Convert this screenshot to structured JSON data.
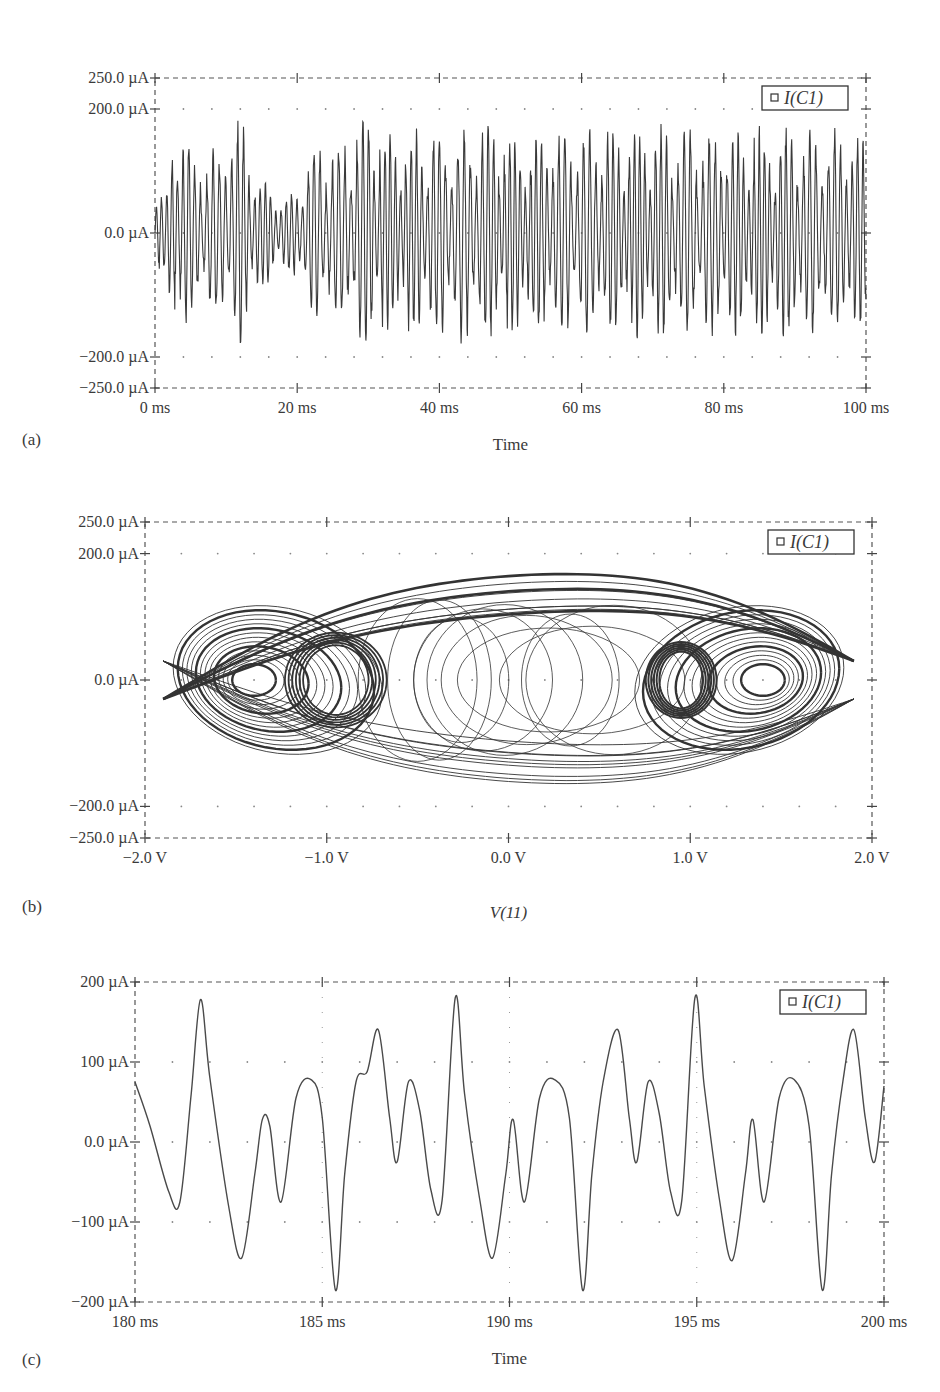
{
  "chart_data": [
    {
      "id": "a",
      "type": "line",
      "panel_label": "(a)",
      "title": "",
      "xlabel": "Time",
      "ylabel": "",
      "legend": [
        {
          "marker": "square",
          "label": "I(C1)"
        }
      ],
      "legend_position": "top-right",
      "xlim": [
        0,
        100
      ],
      "x_unit": "ms",
      "ylim": [
        -250,
        250
      ],
      "y_unit": "µA",
      "grid": "dotted",
      "xticks": [
        0,
        20,
        40,
        60,
        80,
        100
      ],
      "xtick_labels": [
        "0 ms",
        "20 ms",
        "40 ms",
        "60 ms",
        "80 ms",
        "100 ms"
      ],
      "yticks": [
        250,
        200,
        0,
        -200,
        -250
      ],
      "ytick_labels": [
        "250.0 µA",
        "200.0 µA",
        "0.0 µA",
        "−200.0 µA",
        "−250.0 µA"
      ],
      "series": [
        {
          "name": "I(C1)",
          "description": "Dense chaotic oscillation, roughly ±200 µA envelope, ~1.2 kHz carrier",
          "envelope_peaks_uA": {
            "max": 210,
            "min": -230
          },
          "approx_samples_ms_uA": [
            [
              0.3,
              80
            ],
            [
              1.5,
              -60
            ],
            [
              2.5,
              160
            ],
            [
              3.3,
              -230
            ],
            [
              4.2,
              180
            ],
            [
              5.2,
              -130
            ],
            [
              7,
              140
            ],
            [
              9,
              -140
            ],
            [
              10,
              180
            ],
            [
              12,
              -200
            ],
            [
              14,
              110
            ],
            [
              16,
              -90
            ],
            [
              18,
              60
            ],
            [
              20,
              -80
            ],
            [
              22,
              150
            ],
            [
              24,
              -150
            ],
            [
              26,
              150
            ],
            [
              28,
              -190
            ],
            [
              30,
              210
            ],
            [
              32,
              -180
            ],
            [
              36,
              170
            ],
            [
              38,
              -180
            ],
            [
              44,
              180
            ],
            [
              46,
              -200
            ],
            [
              50,
              180
            ],
            [
              52,
              -170
            ],
            [
              60,
              180
            ],
            [
              62,
              -180
            ],
            [
              70,
              180
            ],
            [
              72,
              -180
            ],
            [
              80,
              180
            ],
            [
              84,
              -180
            ],
            [
              90,
              180
            ],
            [
              94,
              -180
            ],
            [
              99,
              180
            ],
            [
              100,
              -140
            ]
          ]
        }
      ]
    },
    {
      "id": "b",
      "type": "line",
      "subtype": "phase-portrait",
      "panel_label": "(b)",
      "title": "",
      "xlabel": "V(11)",
      "ylabel": "",
      "legend": [
        {
          "marker": "square",
          "label": "I(C1)"
        }
      ],
      "legend_position": "top-right",
      "xlim": [
        -2.0,
        2.0
      ],
      "x_unit": "V",
      "ylim": [
        -250,
        250
      ],
      "y_unit": "µA",
      "grid": "dotted",
      "xticks": [
        -2,
        -1,
        0,
        1,
        2
      ],
      "xtick_labels": [
        "−2.0 V",
        "−1.0 V",
        "0.0 V",
        "1.0 V",
        "2.0 V"
      ],
      "yticks": [
        250,
        200,
        0,
        -200,
        -250
      ],
      "ytick_labels": [
        "250.0 µA",
        "200.0 µA",
        "0.0 µA",
        "−200.0 µA",
        "−250.0 µA"
      ],
      "series": [
        {
          "name": "I(C1)",
          "description": "Double-scroll chaotic attractor; scroll centers near (−1.4 V, 0) and (1.4 V, 0); inner loops near ±1.0 V",
          "extent": {
            "x": [
              -1.95,
              1.95
            ],
            "y": [
              -230,
              210
            ]
          },
          "scroll_centers": [
            [
              -1.4,
              0
            ],
            [
              1.4,
              0
            ]
          ],
          "inner_loop_centers": [
            [
              -1.0,
              0
            ],
            [
              1.0,
              0
            ]
          ]
        }
      ]
    },
    {
      "id": "c",
      "type": "line",
      "panel_label": "(c)",
      "title": "",
      "xlabel": "Time",
      "ylabel": "",
      "legend": [
        {
          "marker": "square",
          "label": "I(C1)"
        }
      ],
      "legend_position": "top-right",
      "xlim": [
        180,
        200
      ],
      "x_unit": "ms",
      "ylim": [
        -200,
        200
      ],
      "y_unit": "µA",
      "grid": "dotted",
      "xticks": [
        180,
        185,
        190,
        195,
        200
      ],
      "xtick_labels": [
        "180 ms",
        "185 ms",
        "190 ms",
        "195 ms",
        "200 ms"
      ],
      "yticks": [
        200,
        100,
        0,
        -100,
        -200
      ],
      "ytick_labels": [
        "200 µA",
        "100 µA",
        "0.0 µA",
        "−100 µA",
        "−200 µA"
      ],
      "series": [
        {
          "name": "I(C1)",
          "description": "Zoomed periodic-like waveform, period ≈ 3.9 ms with multiple sub-peaks",
          "points": [
            [
              180.0,
              75
            ],
            [
              180.4,
              20
            ],
            [
              180.9,
              -62
            ],
            [
              181.2,
              -75
            ],
            [
              181.5,
              60
            ],
            [
              181.75,
              178
            ],
            [
              182.0,
              80
            ],
            [
              182.5,
              -80
            ],
            [
              182.85,
              -145
            ],
            [
              183.2,
              -40
            ],
            [
              183.4,
              28
            ],
            [
              183.6,
              20
            ],
            [
              183.9,
              -75
            ],
            [
              184.3,
              55
            ],
            [
              184.7,
              78
            ],
            [
              185.0,
              30
            ],
            [
              185.35,
              -185
            ],
            [
              185.6,
              -40
            ],
            [
              185.9,
              75
            ],
            [
              186.2,
              88
            ],
            [
              186.5,
              140
            ],
            [
              186.8,
              30
            ],
            [
              187.0,
              -25
            ],
            [
              187.3,
              75
            ],
            [
              187.6,
              40
            ],
            [
              187.9,
              -60
            ],
            [
              188.2,
              -73
            ],
            [
              188.55,
              180
            ],
            [
              188.8,
              60
            ],
            [
              189.2,
              -70
            ],
            [
              189.55,
              -145
            ],
            [
              189.9,
              -40
            ],
            [
              190.1,
              28
            ],
            [
              190.4,
              -75
            ],
            [
              190.8,
              55
            ],
            [
              191.2,
              78
            ],
            [
              191.6,
              30
            ],
            [
              191.95,
              -185
            ],
            [
              192.2,
              -40
            ],
            [
              192.5,
              75
            ],
            [
              192.9,
              140
            ],
            [
              193.2,
              30
            ],
            [
              193.4,
              -25
            ],
            [
              193.7,
              75
            ],
            [
              194.0,
              35
            ],
            [
              194.3,
              -62
            ],
            [
              194.6,
              -73
            ],
            [
              194.95,
              180
            ],
            [
              195.2,
              70
            ],
            [
              195.6,
              -70
            ],
            [
              195.95,
              -148
            ],
            [
              196.3,
              -40
            ],
            [
              196.5,
              28
            ],
            [
              196.8,
              -75
            ],
            [
              197.2,
              55
            ],
            [
              197.6,
              78
            ],
            [
              198.0,
              20
            ],
            [
              198.35,
              -185
            ],
            [
              198.6,
              -40
            ],
            [
              198.9,
              75
            ],
            [
              199.2,
              140
            ],
            [
              199.5,
              30
            ],
            [
              199.75,
              -25
            ],
            [
              200.0,
              70
            ],
            [
              200.3,
              -72
            ]
          ]
        }
      ]
    }
  ],
  "figure": {
    "panels": [
      {
        "label": "(a)",
        "xlabel": "Time",
        "legend_label": "I(C1)"
      },
      {
        "label": "(b)",
        "xlabel": "V(11)",
        "legend_label": "I(C1)"
      },
      {
        "label": "(c)",
        "xlabel": "Time",
        "legend_label": "I(C1)"
      }
    ]
  }
}
